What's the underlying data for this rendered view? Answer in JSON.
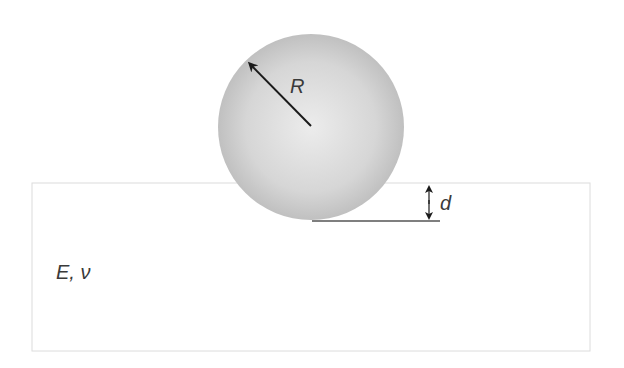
{
  "diagram": {
    "labels": {
      "radius": "R",
      "depth": "d",
      "material": "E, ν"
    },
    "sphere": {
      "cx": 311,
      "cy": 127,
      "r": 93,
      "fill_center": "#e9e9e9",
      "fill_edge": "#c2c2c2"
    },
    "substrate": {
      "x": 32,
      "y": 183,
      "width": 558,
      "height": 168,
      "stroke": "#dcdcdc"
    },
    "colors": {
      "arrow": "#1a1a1a",
      "line": "#555555",
      "text": "#3a3a3a"
    }
  }
}
